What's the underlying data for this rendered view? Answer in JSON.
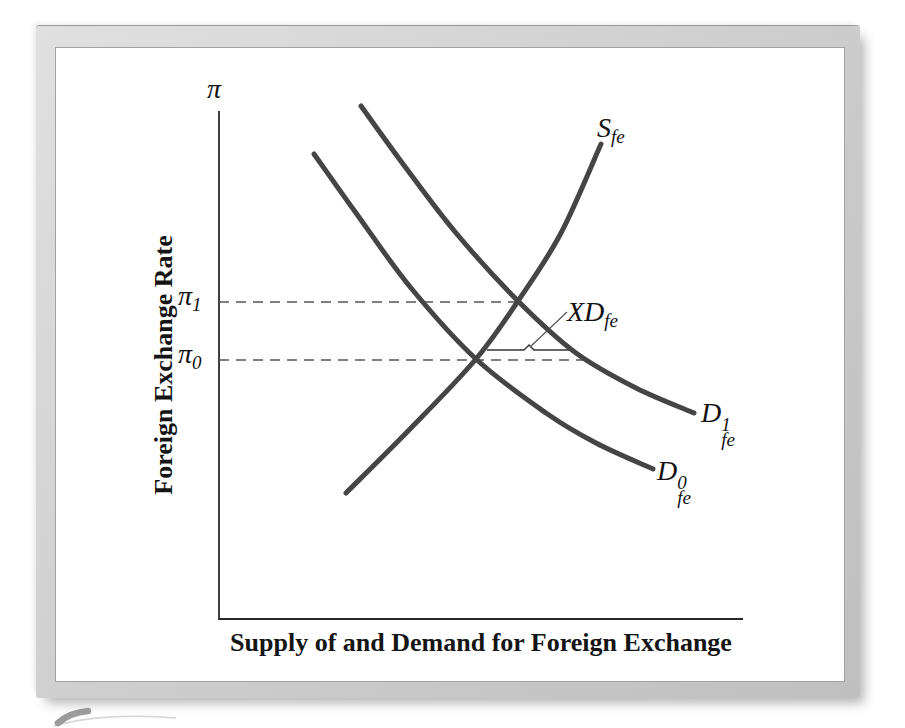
{
  "figure_type": "textbook-economics-diagram",
  "labels": {
    "y_symbol": "π",
    "pi1": {
      "base": "π",
      "sub": "1"
    },
    "pi0": {
      "base": "π",
      "sub": "0"
    },
    "supply": {
      "base": "S",
      "sub": "fe"
    },
    "demand1": {
      "base": "D",
      "sup": "1",
      "sub": "fe"
    },
    "demand0": {
      "base": "D",
      "sup": "0",
      "sub": "fe"
    },
    "excess_demand": {
      "base": "XD",
      "sub": "fe"
    }
  },
  "colors": {
    "curve": "#454545",
    "axis": "#2a2a2a",
    "dashes": "#555555",
    "text": "#121212",
    "frame_light": "#e0e0e0",
    "frame_dark": "#bfbfbf",
    "swoosh": "#9b9b9b"
  },
  "chart_data": {
    "type": "line",
    "title": "",
    "xlabel": "Supply of and Demand for Foreign Exchange",
    "ylabel": "Foreign Exchange Rate",
    "y_axis_symbol": "π",
    "axes_numeric": false,
    "note": "Schematic supply/demand diagram; points are canvas px, y increases downward",
    "canvas": {
      "width": 790,
      "height": 635
    },
    "axis": {
      "origin": [
        163,
        571
      ],
      "y_top": 63,
      "x_right": 687
    },
    "series": [
      {
        "name": "S_fe",
        "role": "supply-curve",
        "points": [
          [
            290,
            445
          ],
          [
            355,
            380
          ],
          [
            420,
            311
          ],
          [
            462,
            253
          ],
          [
            505,
            185
          ],
          [
            545,
            96
          ]
        ]
      },
      {
        "name": "D0_fe",
        "role": "initial-demand-curve",
        "points": [
          [
            258,
            106
          ],
          [
            300,
            165
          ],
          [
            355,
            240
          ],
          [
            420,
            311
          ],
          [
            490,
            365
          ],
          [
            540,
            395
          ],
          [
            597,
            421
          ]
        ]
      },
      {
        "name": "D1_fe",
        "role": "shifted-demand-curve",
        "points": [
          [
            305,
            58
          ],
          [
            350,
            120
          ],
          [
            400,
            185
          ],
          [
            462,
            253
          ],
          [
            520,
            305
          ],
          [
            580,
            340
          ],
          [
            638,
            365
          ]
        ]
      }
    ],
    "equilibria": [
      {
        "label": "π1",
        "point": [
          462,
          253
        ],
        "dash_y": 254,
        "dash_x_from": 163,
        "dash_x_to": 462
      },
      {
        "label": "π0",
        "point": [
          420,
          311
        ],
        "dash_y": 312,
        "dash_x_from": 163,
        "dash_x_to": 532
      }
    ],
    "excess_demand_marker": {
      "label": "XD_fe",
      "y": 302,
      "x_from": 431,
      "x_to": 513,
      "notch_x": 473,
      "leader_from": [
        511,
        264
      ],
      "leader_to": [
        474,
        299
      ]
    },
    "legend": "none",
    "grid": false
  }
}
